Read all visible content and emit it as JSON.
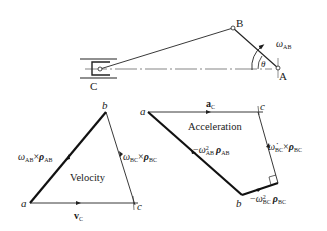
{
  "mechanism": {
    "points": {
      "A": "A",
      "B": "B",
      "C": "C"
    },
    "angle_label": "θ",
    "omega_label": {
      "sym": "ω",
      "sub": "AB"
    }
  },
  "velocity": {
    "title": "Velocity",
    "vertices": {
      "a": "a",
      "b": "b",
      "c": "c"
    },
    "ab_label": {
      "w": "ω",
      "wsub": "AB",
      "x": "×",
      "rho": "ρ",
      "rsub": "AB"
    },
    "bc_label": {
      "w": "ω",
      "wsub": "BC",
      "x": "×",
      "rho": "ρ",
      "rsub": "BC"
    },
    "ac_label": {
      "v": "v",
      "sub": "C"
    }
  },
  "acceleration": {
    "title": "Acceleration",
    "vertices": {
      "a": "a",
      "b": "b",
      "c": "c"
    },
    "ac_label": {
      "a": "a",
      "sub": "C"
    },
    "ab_label": {
      "minus": "−",
      "w": "ω",
      "sup": "2",
      "wsub": "AB",
      "rho": "ρ",
      "rsub": "AB"
    },
    "bcorner_label": {
      "minus": "−",
      "w": "ω",
      "sup": "2",
      "wsub": "BC",
      "rho": "ρ",
      "rsub": "BC"
    },
    "cc_label": {
      "w": "ω̇",
      "wsub": "BC",
      "x": "×",
      "rho": "ρ",
      "rsub": "BC"
    }
  }
}
